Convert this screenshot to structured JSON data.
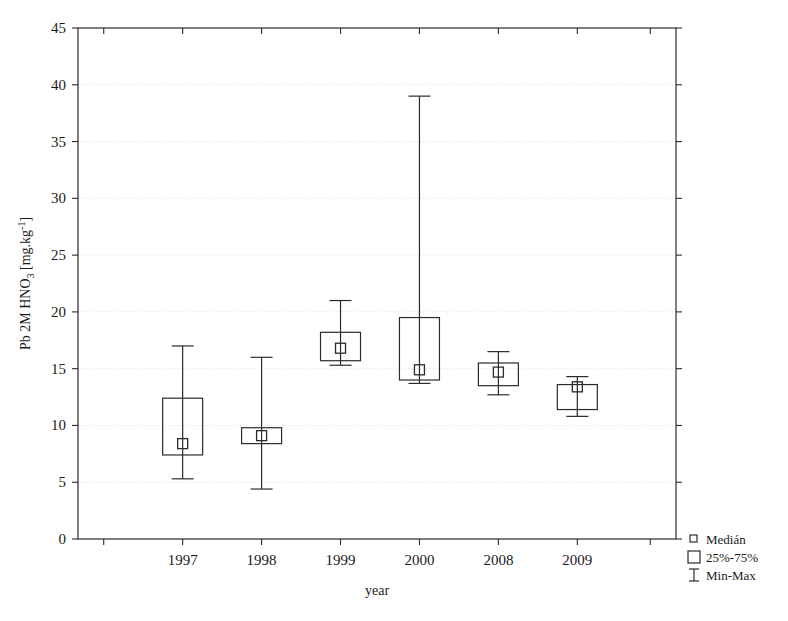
{
  "chart_data": {
    "type": "box",
    "title": "",
    "xlabel": "year",
    "ylabel": "Pb 2M HNO3 [mg.kg-1]",
    "ylabel_parts": {
      "prefix": "Pb 2M HNO",
      "sub1": "3",
      "mid": " [mg.kg",
      "sup1": "-1",
      "suffix": "]"
    },
    "categories": [
      "1997",
      "1998",
      "1999",
      "2000",
      "2008",
      "2009"
    ],
    "ylim": [
      0,
      45
    ],
    "yticks": [
      0,
      5,
      10,
      15,
      20,
      25,
      30,
      35,
      40,
      45
    ],
    "grid": true,
    "grid_axis": "y",
    "legend_position": "right-bottom",
    "boxes": [
      {
        "category": "1997",
        "min": 5.3,
        "q1": 7.4,
        "median": 8.4,
        "q3": 12.4,
        "max": 17.0
      },
      {
        "category": "1998",
        "min": 4.4,
        "q1": 8.4,
        "median": 9.1,
        "q3": 9.8,
        "max": 16.0
      },
      {
        "category": "1999",
        "min": 15.3,
        "q1": 15.7,
        "median": 16.8,
        "q3": 18.2,
        "max": 21.0
      },
      {
        "category": "2000",
        "min": 13.7,
        "q1": 14.0,
        "median": 14.9,
        "q3": 19.5,
        "max": 39.0
      },
      {
        "category": "2008",
        "min": 12.7,
        "q1": 13.5,
        "median": 14.7,
        "q3": 15.5,
        "max": 16.5
      },
      {
        "category": "2009",
        "min": 10.8,
        "q1": 11.4,
        "median": 13.4,
        "q3": 13.6,
        "max": 14.3
      }
    ]
  },
  "legend": {
    "items": [
      {
        "label": "Medián",
        "glyph": "small-square"
      },
      {
        "label": "25%-75%",
        "glyph": "large-square"
      },
      {
        "label": "Min-Max",
        "glyph": "i-bar"
      }
    ]
  },
  "colors": {
    "line": "#2b2b2b",
    "grid": "#d8d8d8",
    "background": "#ffffff",
    "text": "#1a1a1a"
  }
}
